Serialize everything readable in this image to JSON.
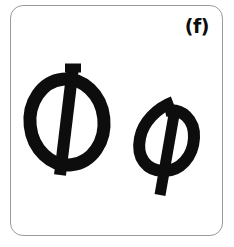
{
  "figure": {
    "panel_label": "(f)",
    "background_color": "#ffffff",
    "border_color": "#9a9a9a",
    "glyph_color": "#0d0d0d",
    "glyphs": [
      {
        "name": "uppercase-phi",
        "character": "Φ",
        "description": "Greek capital letter Phi",
        "style": "italic oval with vertical stroke"
      },
      {
        "name": "lowercase-phi",
        "character": "φ",
        "description": "Greek small letter phi",
        "style": "cursive italic loop with descender"
      }
    ]
  }
}
